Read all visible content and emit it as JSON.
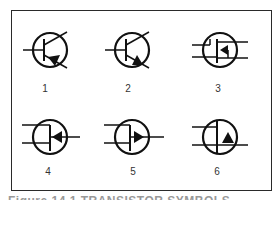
{
  "figure": {
    "symbols": [
      {
        "id": 1,
        "label": "1",
        "type": "bipolar-transistor-npn"
      },
      {
        "id": 2,
        "label": "2",
        "type": "bipolar-transistor-pnp-arrow"
      },
      {
        "id": 3,
        "label": "3",
        "type": "mosfet-p-channel"
      },
      {
        "id": 4,
        "label": "4",
        "type": "jfet-n-channel-arrow-in"
      },
      {
        "id": 5,
        "label": "5",
        "type": "jfet-p-channel-arrow-out"
      },
      {
        "id": 6,
        "label": "6",
        "type": "igfet-arrow"
      }
    ],
    "caption": "Figure 14.1  TRANSISTOR SYMBOLS"
  }
}
